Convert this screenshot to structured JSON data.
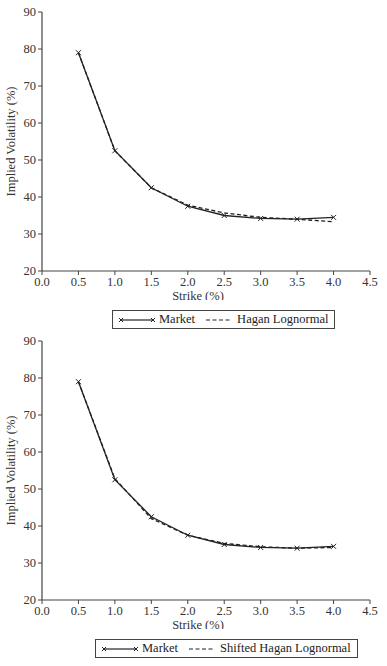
{
  "chart_data": [
    {
      "type": "line",
      "title": "",
      "xlabel": "Strike (%)",
      "ylabel": "Implied Volatility (%)",
      "xlim": [
        0.0,
        4.5
      ],
      "ylim": [
        20,
        90
      ],
      "x_ticks": [
        "0.0",
        "0.5",
        "1.0",
        "1.5",
        "2.0",
        "2.5",
        "3.0",
        "3.5",
        "4.0",
        "4.5"
      ],
      "y_ticks": [
        "20",
        "30",
        "40",
        "50",
        "60",
        "70",
        "80",
        "90"
      ],
      "grid": false,
      "legend_position": "bottom",
      "x": [
        0.5,
        1.0,
        1.5,
        2.0,
        2.5,
        3.0,
        3.5,
        4.0
      ],
      "series": [
        {
          "name": "Market",
          "style": "solid-x-markers",
          "values": [
            79.0,
            52.5,
            42.5,
            37.5,
            35.0,
            34.2,
            34.0,
            34.5
          ]
        },
        {
          "name": "Hagan Lognormal",
          "style": "dashed",
          "values": [
            79.0,
            52.5,
            42.5,
            37.8,
            35.7,
            34.5,
            34.0,
            33.3
          ]
        }
      ]
    },
    {
      "type": "line",
      "title": "",
      "xlabel": "Strike (%)",
      "ylabel": "Implied Volatility (%)",
      "xlim": [
        0.0,
        4.5
      ],
      "ylim": [
        20,
        90
      ],
      "x_ticks": [
        "0.0",
        "0.5",
        "1.0",
        "1.5",
        "2.0",
        "2.5",
        "3.0",
        "3.5",
        "4.0",
        "4.5"
      ],
      "y_ticks": [
        "20",
        "30",
        "40",
        "50",
        "60",
        "70",
        "80",
        "90"
      ],
      "grid": false,
      "legend_position": "bottom",
      "x": [
        0.5,
        1.0,
        1.5,
        2.0,
        2.5,
        3.0,
        3.5,
        4.0
      ],
      "series": [
        {
          "name": "Market",
          "style": "solid-x-markers",
          "values": [
            79.0,
            52.5,
            42.5,
            37.5,
            35.0,
            34.2,
            34.0,
            34.5
          ]
        },
        {
          "name": "Shifted Hagan Lognormal",
          "style": "dashed",
          "values": [
            79.0,
            52.8,
            42.0,
            37.5,
            35.3,
            34.4,
            34.0,
            34.2
          ]
        }
      ]
    }
  ],
  "charts": [
    {
      "xlabel": "Strike (%)",
      "ylabel": "Implied Volatility (%)",
      "legend": [
        "Market",
        "Hagan Lognormal"
      ]
    },
    {
      "xlabel": "Strike (%)",
      "ylabel": "Implied Volatility (%)",
      "legend": [
        "Market",
        "Shifted Hagan Lognormal"
      ]
    }
  ]
}
